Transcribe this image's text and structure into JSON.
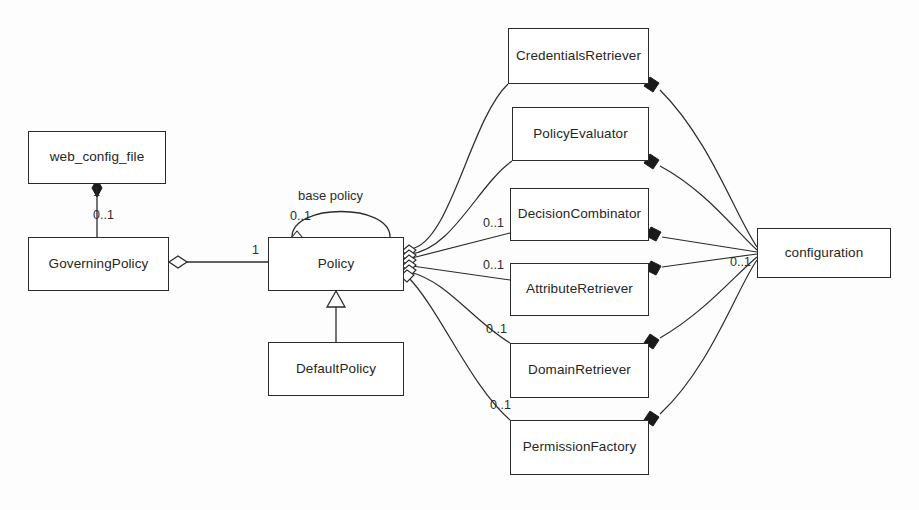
{
  "diagram": {
    "type": "uml-class-diagram",
    "classes": [
      {
        "id": "web_config_file",
        "name": "web_config_file",
        "x": 28,
        "y": 131,
        "w": 138,
        "h": 53
      },
      {
        "id": "governing_policy",
        "name": "GoverningPolicy",
        "x": 28,
        "y": 237,
        "w": 141,
        "h": 54
      },
      {
        "id": "policy",
        "name": "Policy",
        "x": 268,
        "y": 237,
        "w": 136,
        "h": 54
      },
      {
        "id": "default_policy",
        "name": "DefaultPolicy",
        "x": 268,
        "y": 342,
        "w": 136,
        "h": 54
      },
      {
        "id": "credentials_retriever",
        "name": "CredentialsRetriever",
        "x": 508,
        "y": 28,
        "w": 141,
        "h": 56
      },
      {
        "id": "policy_evaluator",
        "name": "PolicyEvaluator",
        "x": 512,
        "y": 107,
        "w": 137,
        "h": 54
      },
      {
        "id": "decision_combinator",
        "name": "DecisionCombinator",
        "x": 510,
        "y": 188,
        "w": 139,
        "h": 53
      },
      {
        "id": "attribute_retriever",
        "name": "AttributeRetriever",
        "x": 510,
        "y": 263,
        "w": 139,
        "h": 53
      },
      {
        "id": "domain_retriever",
        "name": "DomainRetriever",
        "x": 510,
        "y": 343,
        "w": 139,
        "h": 55
      },
      {
        "id": "permission_factory",
        "name": "PermissionFactory",
        "x": 510,
        "y": 420,
        "w": 139,
        "h": 55
      },
      {
        "id": "configuration",
        "name": "configuration",
        "x": 757,
        "y": 228,
        "w": 134,
        "h": 50
      }
    ],
    "labels": [
      {
        "id": "web-config-one",
        "text": "1",
        "x": 93,
        "y": 185
      },
      {
        "id": "governing-zero-one",
        "text": "0..1",
        "x": 93,
        "y": 212
      },
      {
        "id": "base-policy-name",
        "text": "base policy",
        "x": 298,
        "y": 190,
        "kind": "assoc-name"
      },
      {
        "id": "base-policy-mult",
        "text": "0..1",
        "x": 290,
        "y": 211
      },
      {
        "id": "policy-left-one",
        "text": "1",
        "x": 252,
        "y": 245
      },
      {
        "id": "decision-mult",
        "text": "0..1",
        "x": 483,
        "y": 216
      },
      {
        "id": "attribute-mult",
        "text": "0..1",
        "x": 483,
        "y": 259
      },
      {
        "id": "domain-mult",
        "text": "0..1",
        "x": 486,
        "y": 323
      },
      {
        "id": "permission-mult",
        "text": "0..1",
        "x": 490,
        "y": 399
      },
      {
        "id": "configuration-mult",
        "text": "0..1",
        "x": 730,
        "y": 257
      }
    ],
    "relationships": [
      {
        "from": "web_config_file",
        "to": "governing_policy",
        "kind": "composition",
        "source_mult": "1",
        "target_mult": "0..1"
      },
      {
        "from": "governing_policy",
        "to": "policy",
        "kind": "aggregation",
        "target_mult": "1"
      },
      {
        "from": "default_policy",
        "to": "policy",
        "kind": "generalization"
      },
      {
        "from": "policy",
        "to": "policy",
        "kind": "aggregation",
        "name": "base policy",
        "target_mult": "0..1"
      },
      {
        "from": "policy",
        "to": "credentials_retriever",
        "kind": "aggregation"
      },
      {
        "from": "policy",
        "to": "policy_evaluator",
        "kind": "aggregation"
      },
      {
        "from": "policy",
        "to": "decision_combinator",
        "kind": "aggregation",
        "target_mult": "0..1"
      },
      {
        "from": "policy",
        "to": "attribute_retriever",
        "kind": "aggregation",
        "target_mult": "0..1"
      },
      {
        "from": "policy",
        "to": "domain_retriever",
        "kind": "aggregation",
        "target_mult": "0..1"
      },
      {
        "from": "policy",
        "to": "permission_factory",
        "kind": "aggregation",
        "target_mult": "0..1"
      },
      {
        "from": "credentials_retriever",
        "to": "configuration",
        "kind": "composition"
      },
      {
        "from": "policy_evaluator",
        "to": "configuration",
        "kind": "composition"
      },
      {
        "from": "decision_combinator",
        "to": "configuration",
        "kind": "composition"
      },
      {
        "from": "attribute_retriever",
        "to": "configuration",
        "kind": "composition"
      },
      {
        "from": "domain_retriever",
        "to": "configuration",
        "kind": "composition"
      },
      {
        "from": "permission_factory",
        "to": "configuration",
        "kind": "composition",
        "source_mult": "0..1"
      }
    ],
    "colors": {
      "line": "#2b2b2b",
      "box_fill": "#ffffff",
      "text": "#262626",
      "background": "#fdfdfd"
    }
  }
}
